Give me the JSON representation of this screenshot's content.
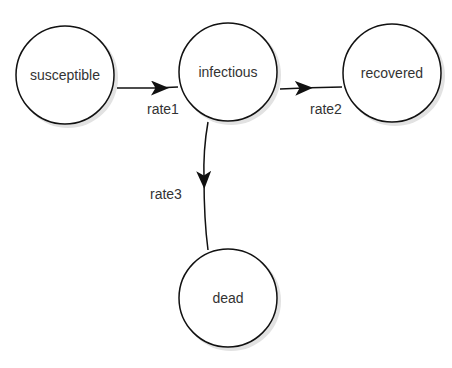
{
  "nodes": {
    "susceptible": {
      "label": "susceptible"
    },
    "infectious": {
      "label": "infectious"
    },
    "recovered": {
      "label": "recovered"
    },
    "dead": {
      "label": "dead"
    }
  },
  "edges": {
    "rate1": {
      "label": "rate1",
      "from": "susceptible",
      "to": "infectious"
    },
    "rate2": {
      "label": "rate2",
      "from": "infectious",
      "to": "recovered"
    },
    "rate3": {
      "label": "rate3",
      "from": "infectious",
      "to": "dead"
    }
  },
  "colors": {
    "stroke": "#111111",
    "shadow": "#cfcfcf",
    "text": "#333333"
  }
}
